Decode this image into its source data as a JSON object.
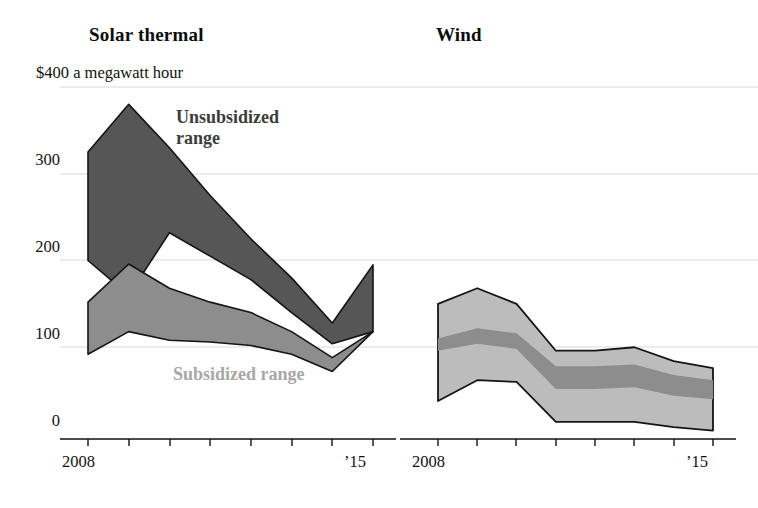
{
  "charts": {
    "solar": {
      "title": "Solar thermal"
    },
    "wind": {
      "title": "Wind"
    }
  },
  "axis": {
    "unit_label": "$400 a megawatt hour",
    "y_ticks": [
      "300",
      "200",
      "100",
      "0"
    ],
    "x_start": "2008",
    "x_end": "’15"
  },
  "legend": {
    "unsubsidized": "Unsubsidized range",
    "unsubsidized_line1": "Unsubsidized",
    "unsubsidized_line2": "range",
    "subsidized": "Subsidized range"
  },
  "colors": {
    "unsubsidized_band": "#565656",
    "subsidized_band": "#8d8d8d",
    "wind_outer_band": "#bcbcbc",
    "wind_inner_band": "#8d8d8d",
    "gridline": "#d9d9d9",
    "axis": "#111111"
  },
  "chart_data": [
    {
      "type": "area",
      "title": "Solar thermal",
      "xlabel": "",
      "ylabel": "$ a megawatt hour",
      "ylim": [
        0,
        400
      ],
      "xlim": [
        2008,
        2015
      ],
      "grid": true,
      "legend_position": "inline-annotation",
      "x": [
        2008,
        2009,
        2010,
        2011,
        2012,
        2013,
        2014,
        2015
      ],
      "series": [
        {
          "name": "Unsubsidized range high",
          "values": [
            325,
            380,
            330,
            275,
            225,
            180,
            128,
            195
          ]
        },
        {
          "name": "Unsubsidized range low",
          "values": [
            200,
            160,
            232,
            205,
            178,
            140,
            104,
            118
          ]
        },
        {
          "name": "Subsidized range high",
          "values": [
            152,
            196,
            168,
            152,
            140,
            118,
            88,
            118
          ]
        },
        {
          "name": "Subsidized range low",
          "values": [
            92,
            118,
            108,
            106,
            102,
            92,
            72,
            118
          ]
        }
      ]
    },
    {
      "type": "area",
      "title": "Wind",
      "xlabel": "",
      "ylabel": "$ a megawatt hour",
      "ylim": [
        0,
        400
      ],
      "xlim": [
        2008,
        2015
      ],
      "grid": true,
      "legend_position": "inline-annotation",
      "x": [
        2008,
        2009,
        2010,
        2011,
        2012,
        2013,
        2014,
        2015
      ],
      "series": [
        {
          "name": "Subsidized range high",
          "values": [
            150,
            168,
            150,
            96,
            96,
            100,
            84,
            76
          ]
        },
        {
          "name": "Unsubsidized range high",
          "values": [
            110,
            122,
            116,
            78,
            78,
            80,
            68,
            62
          ]
        },
        {
          "name": "Unsubsidized range low",
          "values": [
            96,
            104,
            98,
            52,
            52,
            54,
            44,
            40
          ]
        },
        {
          "name": "Subsidized range low",
          "values": [
            38,
            62,
            60,
            14,
            14,
            14,
            8,
            4
          ]
        }
      ]
    }
  ],
  "axis_geometry": {
    "y_tick_values": [
      400,
      300,
      200,
      100,
      0
    ],
    "solar_x_ticks": 8,
    "wind_x_ticks": 8
  }
}
